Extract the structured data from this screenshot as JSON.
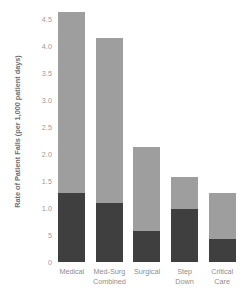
{
  "chart_data": {
    "type": "bar",
    "title": "",
    "subtitle": "",
    "xlabel": "",
    "ylabel": "Rate of Patient Falls (per 1,000 patient days)",
    "categories": [
      "Medical",
      "Med-Surg Combined",
      "Surgical",
      "Step Down",
      "Critical Care"
    ],
    "category_lines": [
      [
        "Medical"
      ],
      [
        "Med-Surg",
        "Combined"
      ],
      [
        "Surgical"
      ],
      [
        "Step",
        "Down"
      ],
      [
        "Critical",
        "Care"
      ]
    ],
    "stacked": true,
    "series": [
      {
        "name": "Injurious falls",
        "color": "#3f3f3f",
        "values": [
          1.27,
          1.1,
          0.58,
          0.99,
          0.43
        ]
      },
      {
        "name": "Non-injurious falls",
        "color": "#9e9e9e",
        "values": [
          3.35,
          3.05,
          1.55,
          0.59,
          0.84
        ]
      }
    ],
    "totals": [
      4.62,
      4.15,
      2.13,
      1.58,
      1.27
    ],
    "ylim": [
      0,
      4.85
    ],
    "yticks": [
      0,
      0.5,
      1.0,
      1.5,
      2.0,
      2.5,
      3.0,
      3.5,
      4.0,
      4.5
    ],
    "ytick_labels": [
      "0",
      "5",
      "1.0",
      "1.5",
      "2.0",
      "2.5",
      "3.0",
      "3.5",
      "4.0",
      "4.5"
    ],
    "grid": false,
    "legend": "none",
    "colors": {
      "background": "#ffffff",
      "bar_dark": "#3f3f3f",
      "bar_light": "#9e9e9e",
      "tick_text": "#9a9a9a",
      "axis_title_text": "#6f6f6f"
    }
  }
}
